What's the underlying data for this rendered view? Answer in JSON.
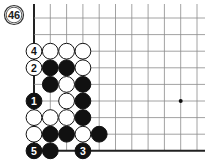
{
  "diagram": {
    "number_label": "46",
    "board": {
      "origin_x": 34,
      "origin_y": 18,
      "spacing_x": 16.3,
      "spacing_y": 16.6,
      "cols": 11,
      "rows": 9,
      "left_edge": true,
      "bottom_edge": true,
      "line_color": "#8a8a8a",
      "edge_color": "#222222",
      "star_points": [
        [
          9,
          5
        ]
      ]
    },
    "stones": [
      {
        "col": 0,
        "row": 2,
        "color": "white",
        "label": "4"
      },
      {
        "col": 1,
        "row": 2,
        "color": "white",
        "label": ""
      },
      {
        "col": 2,
        "row": 2,
        "color": "white",
        "label": ""
      },
      {
        "col": 3,
        "row": 2,
        "color": "white",
        "label": ""
      },
      {
        "col": 0,
        "row": 3,
        "color": "white",
        "label": "2"
      },
      {
        "col": 1,
        "row": 3,
        "color": "black",
        "label": ""
      },
      {
        "col": 2,
        "row": 3,
        "color": "black",
        "label": ""
      },
      {
        "col": 3,
        "row": 3,
        "color": "white",
        "label": ""
      },
      {
        "col": 1,
        "row": 4,
        "color": "black",
        "label": ""
      },
      {
        "col": 2,
        "row": 4,
        "color": "white",
        "label": ""
      },
      {
        "col": 3,
        "row": 4,
        "color": "black",
        "label": ""
      },
      {
        "col": 0,
        "row": 5,
        "color": "black",
        "label": "1"
      },
      {
        "col": 2,
        "row": 5,
        "color": "white",
        "label": ""
      },
      {
        "col": 3,
        "row": 5,
        "color": "black",
        "label": ""
      },
      {
        "col": 0,
        "row": 6,
        "color": "white",
        "label": ""
      },
      {
        "col": 1,
        "row": 6,
        "color": "white",
        "label": ""
      },
      {
        "col": 2,
        "row": 6,
        "color": "white",
        "label": ""
      },
      {
        "col": 3,
        "row": 6,
        "color": "black",
        "label": ""
      },
      {
        "col": 0,
        "row": 7,
        "color": "white",
        "label": ""
      },
      {
        "col": 1,
        "row": 7,
        "color": "black",
        "label": ""
      },
      {
        "col": 2,
        "row": 7,
        "color": "black",
        "label": ""
      },
      {
        "col": 3,
        "row": 7,
        "color": "white",
        "label": ""
      },
      {
        "col": 4,
        "row": 7,
        "color": "black",
        "label": ""
      },
      {
        "col": 0,
        "row": 8,
        "color": "black",
        "label": "5"
      },
      {
        "col": 1,
        "row": 8,
        "color": "black",
        "label": ""
      },
      {
        "col": 3,
        "row": 8,
        "color": "black",
        "label": "3"
      }
    ]
  }
}
